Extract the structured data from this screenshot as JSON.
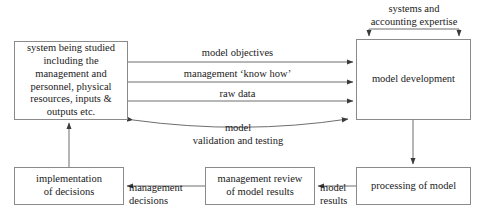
{
  "diagram": {
    "colors": {
      "box_border": "#8a8a8a",
      "line": "#6e6e6e",
      "text": "#1a1a1a",
      "background": "#ffffff"
    },
    "nodes": [
      {
        "id": "system",
        "label": "system being studied\nincluding the\nmanagement and\npersonnel, physical\nresources, inputs &\noutputs etc."
      },
      {
        "id": "model-development",
        "label": "model development"
      },
      {
        "id": "processing-of-model",
        "label": "processing of model"
      },
      {
        "id": "management-review",
        "label": "management review\nof model results"
      },
      {
        "id": "implementation",
        "label": "implementation\nof decisions"
      }
    ],
    "edge_labels": [
      {
        "id": "model-objectives",
        "text": "model objectives"
      },
      {
        "id": "management-know-how",
        "text": "management ‘know how’"
      },
      {
        "id": "raw-data",
        "text": "raw data"
      },
      {
        "id": "model-validation",
        "text": "model\nvalidation and testing"
      },
      {
        "id": "systems-expertise",
        "text": "systems and\naccounting expertise"
      },
      {
        "id": "model-results",
        "text": "model\nresults"
      },
      {
        "id": "management-decisions",
        "text": "management\ndecisions"
      }
    ]
  }
}
